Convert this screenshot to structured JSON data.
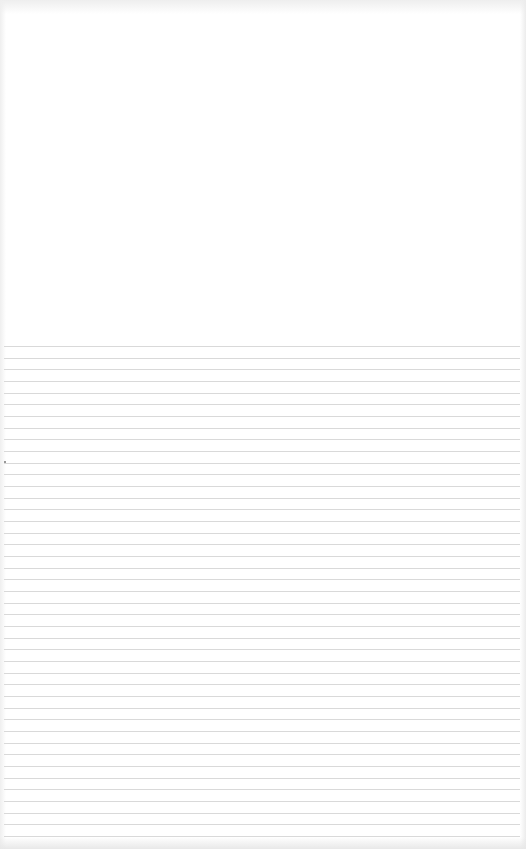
{
  "document": {
    "type": "blank ruled notebook page",
    "text_content": "",
    "ruled_lines": {
      "count": 43,
      "first_line_y": 346,
      "spacing_px": 11.67,
      "color": "#d9d9d9"
    },
    "background_color": "#ffffff"
  }
}
